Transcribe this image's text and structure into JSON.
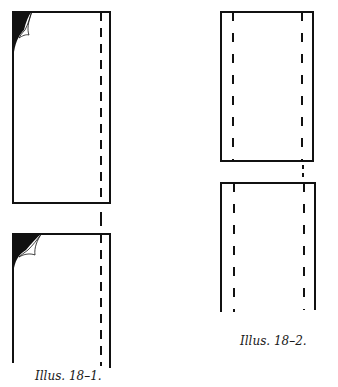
{
  "illustrations": [
    {
      "id": "illus-18-1",
      "caption": "Illus. 18–1.",
      "description": "Two stacked fabric panels, each with a folded-back black top-left corner and one dashed seam line near the right edge; dashed line continues through the gap between panels.",
      "panels": [
        {
          "position": "top",
          "corner_fold": "top-left",
          "dashed_seams": [
            "right"
          ]
        },
        {
          "position": "bottom",
          "corner_fold": "top-left",
          "dashed_seams": [
            "right"
          ],
          "open_bottom": true
        }
      ]
    },
    {
      "id": "illus-18-2",
      "caption": "Illus. 18–2.",
      "description": "Two stacked fabric panels with dashed seam lines near both the left and right edges; right dashed line continues through the gap.",
      "panels": [
        {
          "position": "top",
          "dashed_seams": [
            "left",
            "right"
          ]
        },
        {
          "position": "bottom",
          "dashed_seams": [
            "left",
            "right"
          ],
          "open_bottom": true
        }
      ]
    }
  ],
  "colors": {
    "line": "#111111",
    "background": "#ffffff"
  }
}
